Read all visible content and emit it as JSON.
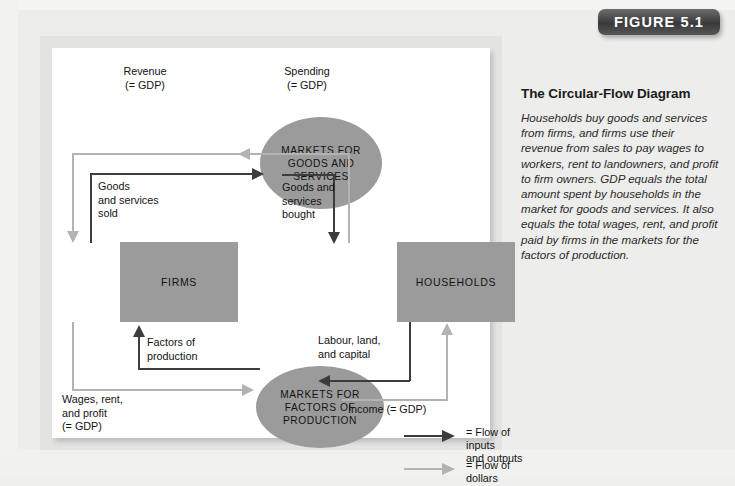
{
  "figure": {
    "badge_label": "FIGURE 5.1",
    "caption_title": "The Circular-Flow Diagram",
    "caption_body": "Households buy goods and services from firms, and firms use their revenue from sales to pay wages to workers, rent to landowners, and profit to firm owners. GDP equals the total amount spent by households in the market for goods and services. It also equals the total wages, rent, and profit paid by firms in the markets for the factors of production."
  },
  "diagram": {
    "nodes": {
      "firms": "FIRMS",
      "households": "HOUSEHOLDS",
      "markets_goods": "MARKETS FOR GOODS AND SERVICES",
      "markets_factors": "MARKETS FOR FACTORS OF PRODUCTION"
    },
    "labels": {
      "revenue": "Revenue\n(= GDP)",
      "spending": "Spending\n(= GDP)",
      "goods_sold": "Goods\nand services\nsold",
      "goods_bought": "Goods and\nservices\nbought",
      "factors_of_production": "Factors of\nproduction",
      "labour_land_capital": "Labour, land,\nand capital",
      "wages_rent_profit": "Wages, rent,\nand profit\n(= GDP)",
      "income": "Income (= GDP)"
    },
    "legend": [
      {
        "marker": "dark-arrow",
        "equals": "=",
        "text": "Flow of inputs\nand outputs"
      },
      {
        "marker": "light-arrow",
        "equals": "=",
        "text": "Flow of dollars"
      }
    ],
    "colors": {
      "node_fill": "#9b9b9b",
      "inputs_outputs_arrow": "#3d3d3d",
      "dollars_arrow": "#b3b3b3",
      "panel_background": "#ffffff",
      "page_background": "#ededec",
      "badge_background": "#3a3a3a"
    }
  }
}
